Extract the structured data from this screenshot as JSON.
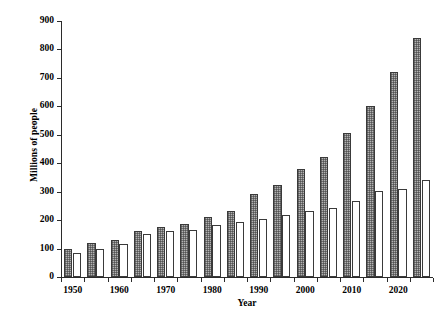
{
  "chart_data": {
    "type": "bar",
    "title": "",
    "xlabel": "Year",
    "ylabel": "Millions of people",
    "grid": false,
    "legend_position": "none",
    "ylim": [
      0,
      900
    ],
    "yticks": [
      0,
      100,
      200,
      300,
      400,
      500,
      600,
      700,
      800,
      900
    ],
    "ytick_labels": [
      "0",
      "100",
      "200",
      "300",
      "400",
      "500",
      "600",
      "700",
      "800",
      "900"
    ],
    "categories": [
      "1950",
      "1955",
      "1960",
      "1965",
      "1970",
      "1975",
      "1980",
      "1985",
      "1990",
      "1995",
      "2000",
      "2005",
      "2010",
      "2015",
      "2020",
      "2025"
    ],
    "xtick_labels": [
      "1950",
      "1960",
      "1970",
      "1980",
      "1990",
      "2000",
      "2010",
      "2020"
    ],
    "series": [
      {
        "name": "shaded",
        "style": "crosshatch",
        "color": "#b3b3b3",
        "values": [
          100,
          118,
          130,
          163,
          176,
          188,
          210,
          232,
          293,
          322,
          380,
          422,
          505,
          602,
          720,
          840
        ]
      },
      {
        "name": "open",
        "style": "white",
        "color": "#ffffff",
        "values": [
          85,
          100,
          115,
          150,
          161,
          166,
          182,
          195,
          203,
          218,
          231,
          243,
          267,
          303,
          310,
          340
        ]
      }
    ]
  }
}
